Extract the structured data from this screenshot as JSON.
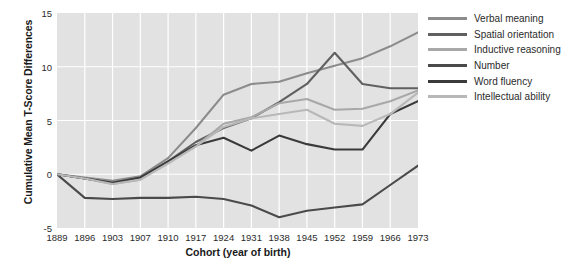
{
  "chart_data": {
    "type": "line",
    "title": "",
    "xlabel": "Cohort (year of birth)",
    "ylabel": "Cumulative Mean T-Score Differences",
    "categories": [
      "1889",
      "1896",
      "1903",
      "1907",
      "1910",
      "1917",
      "1924",
      "1931",
      "1938",
      "1945",
      "1952",
      "1959",
      "1966",
      "1973"
    ],
    "x": [
      1889,
      1896,
      1903,
      1907,
      1910,
      1917,
      1924,
      1931,
      1938,
      1945,
      1952,
      1959,
      1966,
      1973
    ],
    "ylim": [
      -5,
      15
    ],
    "xlim": [
      1889,
      1973
    ],
    "yticks": [
      "15",
      "10",
      "5",
      "0",
      "-5"
    ],
    "ytick_values": [
      15,
      10,
      5,
      0,
      -5
    ],
    "grid": true,
    "legend_position": "right",
    "plot_background": "#e2e2e2",
    "gridline_color": "#ffffff",
    "series": [
      {
        "name": "Verbal meaning",
        "color": "#8c8c8c",
        "values": [
          0.0,
          -0.3,
          -0.6,
          -0.2,
          1.5,
          4.3,
          7.4,
          8.4,
          8.6,
          9.4,
          10.1,
          10.8,
          11.9,
          13.2
        ]
      },
      {
        "name": "Spatial orientation",
        "color": "#606060",
        "values": [
          0.0,
          -0.4,
          -0.8,
          -0.4,
          1.2,
          3.0,
          4.3,
          5.2,
          6.7,
          8.4,
          11.3,
          8.4,
          8.0,
          8.0
        ]
      },
      {
        "name": "Inductive reasoning",
        "color": "#a8a8a8",
        "values": [
          0.0,
          -0.4,
          -0.9,
          -0.5,
          1.1,
          2.6,
          4.7,
          5.3,
          6.6,
          7.0,
          6.0,
          6.1,
          6.8,
          7.8
        ]
      },
      {
        "name": "Number",
        "color": "#4a4a4a",
        "values": [
          0.0,
          -2.2,
          -2.3,
          -2.2,
          -2.2,
          -2.1,
          -2.3,
          -2.9,
          -4.0,
          -3.4,
          -3.1,
          -2.8,
          -1.0,
          0.8
        ]
      },
      {
        "name": "Word fluency",
        "color": "#3a3a3a",
        "values": [
          0.0,
          -0.4,
          -0.8,
          -0.3,
          1.2,
          2.7,
          3.4,
          2.2,
          3.6,
          2.8,
          2.3,
          2.3,
          5.6,
          6.8
        ]
      },
      {
        "name": "Intellectual ability",
        "color": "#b8b8b8",
        "values": [
          0.0,
          -0.4,
          -0.9,
          -0.5,
          1.0,
          2.6,
          4.4,
          5.2,
          5.6,
          6.0,
          4.7,
          4.5,
          5.6,
          7.6
        ]
      }
    ]
  }
}
